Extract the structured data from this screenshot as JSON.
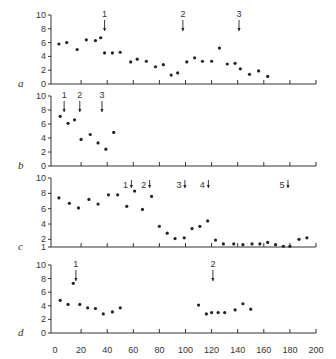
{
  "chart_data": [
    {
      "panel": "a",
      "type": "scatter",
      "ylim": [
        0,
        10
      ],
      "yticks": [
        0,
        2,
        4,
        6,
        8,
        10
      ],
      "xlim": [
        0,
        200
      ],
      "x": [
        3,
        9,
        17,
        24,
        31,
        35,
        38,
        44,
        50,
        58,
        63,
        70,
        77,
        83,
        89,
        94,
        101,
        107,
        113,
        120,
        126,
        132,
        138,
        142,
        149,
        156,
        163
      ],
      "y": [
        5.8,
        6.0,
        5.0,
        6.4,
        6.3,
        6.7,
        4.5,
        4.5,
        4.6,
        3.2,
        3.6,
        3.3,
        2.5,
        2.8,
        1.3,
        1.6,
        3.2,
        3.8,
        3.3,
        3.3,
        5.2,
        2.9,
        3.0,
        2.2,
        1.4,
        1.9,
        1.1
      ],
      "markers": [
        {
          "label": "1",
          "x": 38
        },
        {
          "label": "2",
          "x": 98
        },
        {
          "label": "3",
          "x": 141
        }
      ]
    },
    {
      "panel": "b",
      "type": "scatter",
      "ylim": [
        0,
        10
      ],
      "yticks": [
        0,
        2,
        4,
        6,
        8,
        10
      ],
      "xlim": [
        0,
        200
      ],
      "x": [
        4,
        10,
        15,
        20,
        27,
        33,
        39,
        45
      ],
      "y": [
        7.1,
        6.1,
        6.6,
        3.8,
        4.5,
        3.3,
        2.4,
        4.8
      ],
      "markers": [
        {
          "label": "1",
          "x": 7
        },
        {
          "label": "2",
          "x": 19
        },
        {
          "label": "3",
          "x": 36
        }
      ]
    },
    {
      "panel": "c",
      "type": "scatter",
      "ylim": [
        1,
        10
      ],
      "yticks": [
        1,
        2,
        4,
        6,
        8,
        10
      ],
      "xlim": [
        0,
        200
      ],
      "x": [
        3,
        11,
        18,
        26,
        33,
        41,
        48,
        55,
        61,
        67,
        74,
        80,
        86,
        92,
        99,
        105,
        111,
        117,
        123,
        129,
        137,
        144,
        151,
        157,
        163,
        169,
        175,
        180,
        187,
        193
      ],
      "y": [
        7.4,
        6.7,
        6.1,
        7.2,
        6.6,
        7.8,
        7.8,
        6.3,
        8.3,
        5.9,
        7.6,
        3.7,
        2.8,
        2.1,
        2.2,
        3.4,
        3.7,
        4.4,
        1.9,
        1.4,
        1.4,
        1.3,
        1.4,
        1.4,
        1.6,
        1.3,
        1.1,
        1.1,
        2.0,
        2.2,
        4.1
      ],
      "markers": [
        {
          "label": "1",
          "x": 57
        },
        {
          "label": "2",
          "x": 71
        },
        {
          "label": "3",
          "x": 98
        },
        {
          "label": "4",
          "x": 116
        },
        {
          "label": "5",
          "x": 177
        }
      ]
    },
    {
      "panel": "d",
      "type": "scatter",
      "ylim": [
        0,
        10
      ],
      "yticks": [
        0,
        2,
        4,
        6,
        8,
        10
      ],
      "xlim": [
        0,
        200
      ],
      "xticks": [
        0,
        20,
        40,
        60,
        80,
        100,
        120,
        140,
        160,
        180,
        200
      ],
      "x": [
        4,
        10,
        14,
        19,
        25,
        31,
        37,
        44,
        50,
        110,
        116,
        120,
        125,
        130,
        138,
        144,
        150
      ],
      "y": [
        4.8,
        4.2,
        7.3,
        4.2,
        3.7,
        3.6,
        2.8,
        3.1,
        3.7,
        4.1,
        2.8,
        3.0,
        3.0,
        3.0,
        3.4,
        4.3,
        3.5
      ],
      "markers": [
        {
          "label": "1",
          "x": 16
        },
        {
          "label": "2",
          "x": 121
        }
      ]
    }
  ],
  "panels": [
    {
      "label": "a"
    },
    {
      "label": "b"
    },
    {
      "label": "c"
    },
    {
      "label": "d"
    }
  ],
  "colors": {
    "ink": "#222222",
    "axis": "#333333",
    "background": "#ffffff"
  }
}
